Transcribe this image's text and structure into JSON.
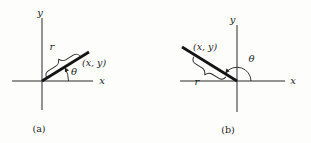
{
  "figure": {
    "colors": {
      "ink": "#1d1d1d",
      "background": "#fdfdfc"
    },
    "panels": {
      "a": {
        "caption": "(a)",
        "x_axis_label": "x",
        "y_axis_label": "y",
        "radius_label": "r",
        "angle_label": "θ",
        "point_label": "(x, y)"
      },
      "b": {
        "caption": "(b)",
        "x_axis_label": "x",
        "y_axis_label": "y",
        "radius_label": "r",
        "angle_label": "θ",
        "point_label": "(x, y)"
      }
    }
  }
}
